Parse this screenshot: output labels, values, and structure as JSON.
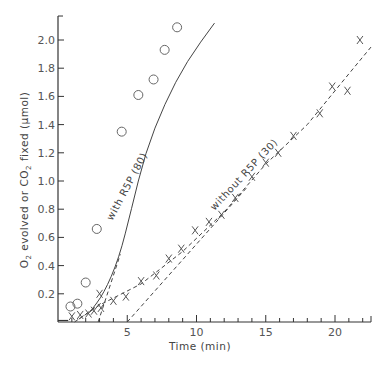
{
  "chart_data": {
    "type": "scatter",
    "title": "",
    "xlabel": "Time (min)",
    "ylabel": "O2 evolved or CO2 fixed (µmol)",
    "ylabel_parts": {
      "pre": "O",
      "sub1": "2",
      "mid": " evolved or CO",
      "sub2": "2",
      "post": " fixed  (µmol)"
    },
    "xlim": [
      0,
      22.6
    ],
    "ylim": [
      0,
      2.17
    ],
    "x_ticks": [
      5,
      10,
      15,
      20
    ],
    "x_tick_labels": [
      "5",
      "10",
      "15",
      "20"
    ],
    "x_minor_step": 1,
    "y_ticks": [
      0.2,
      0.4,
      0.6,
      0.8,
      1.0,
      1.2,
      1.4,
      1.6,
      1.8,
      2.0
    ],
    "y_tick_labels": [
      "0.2",
      "0.4",
      "0.6",
      "0.8",
      "1.0",
      "1.2",
      "1.4",
      "1.6",
      "1.8",
      "2.0"
    ],
    "grid": false,
    "series": [
      {
        "name": "O2 evolved (circles)",
        "marker": "circle",
        "points": [
          [
            0.9,
            0.11
          ],
          [
            1.4,
            0.13
          ],
          [
            2.0,
            0.28
          ],
          [
            2.8,
            0.66
          ],
          [
            4.6,
            1.35
          ],
          [
            5.8,
            1.61
          ],
          [
            6.9,
            1.72
          ],
          [
            7.7,
            1.93
          ],
          [
            8.6,
            2.09
          ]
        ]
      },
      {
        "name": "CO2 fixed (crosses)",
        "marker": "cross",
        "points": [
          [
            1.0,
            0.04
          ],
          [
            1.6,
            0.05
          ],
          [
            2.2,
            0.06
          ],
          [
            2.6,
            0.08
          ],
          [
            3.1,
            0.1
          ],
          [
            3.0,
            0.2
          ],
          [
            4.0,
            0.15
          ],
          [
            4.9,
            0.18
          ],
          [
            6.0,
            0.29
          ],
          [
            7.1,
            0.33
          ],
          [
            8.0,
            0.45
          ],
          [
            8.9,
            0.52
          ],
          [
            9.9,
            0.65
          ],
          [
            10.9,
            0.71
          ],
          [
            11.8,
            0.76
          ],
          [
            12.8,
            0.88
          ],
          [
            14.0,
            1.03
          ],
          [
            15.0,
            1.13
          ],
          [
            15.9,
            1.2
          ],
          [
            17.0,
            1.32
          ],
          [
            18.9,
            1.48
          ],
          [
            19.8,
            1.67
          ],
          [
            20.9,
            1.64
          ],
          [
            21.8,
            2.0
          ]
        ]
      }
    ],
    "lines": [
      {
        "name": "with R5P (80)",
        "style": "solid",
        "points": [
          [
            2.3,
            0.07
          ],
          [
            3.3,
            0.2
          ],
          [
            4.4,
            0.45
          ],
          [
            5.3,
            0.8
          ],
          [
            6.3,
            1.2
          ],
          [
            7.7,
            1.55
          ],
          [
            9.3,
            1.85
          ],
          [
            11.3,
            2.12
          ]
        ]
      },
      {
        "name": "with R5P tangent",
        "style": "dashed",
        "points": [
          [
            2.9,
            0.0
          ],
          [
            4.5,
            0.48
          ]
        ]
      },
      {
        "name": "without R5P (30)",
        "style": "long-dash",
        "points": [
          [
            1.5,
            0.02
          ],
          [
            3.0,
            0.12
          ],
          [
            6.0,
            0.27
          ],
          [
            9.0,
            0.5
          ],
          [
            12.0,
            0.78
          ],
          [
            15.0,
            1.12
          ],
          [
            18.0,
            1.4
          ],
          [
            21.0,
            1.76
          ],
          [
            22.6,
            1.95
          ]
        ]
      },
      {
        "name": "without R5P tangent",
        "style": "dashed",
        "points": [
          [
            5.0,
            0.0
          ],
          [
            13.6,
            0.95
          ]
        ]
      },
      {
        "name": "early dashed",
        "style": "dashed",
        "points": [
          [
            1.2,
            0.0
          ],
          [
            3.2,
            0.14
          ]
        ]
      }
    ],
    "annotations": [
      {
        "text": "with R5P (80)",
        "x": 5.2,
        "y": 0.95,
        "angle": -62
      },
      {
        "text": "without R5P (30)",
        "x": 13.6,
        "y": 1.03,
        "angle": -47
      }
    ]
  }
}
